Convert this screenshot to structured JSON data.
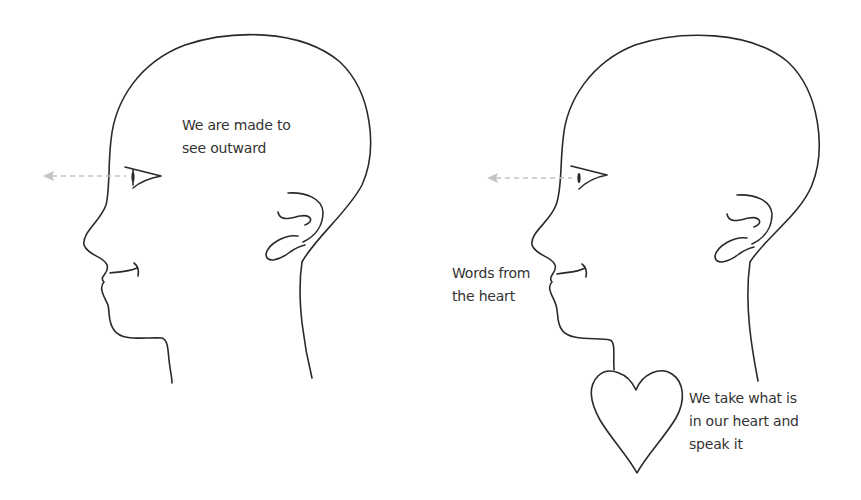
{
  "figure": {
    "left_panel": {
      "caption_lines": [
        "We are made to",
        "see outward"
      ]
    },
    "right_panel": {
      "mouth_caption_lines": [
        "Words from",
        "the heart"
      ],
      "heart_caption_lines": [
        "We take what is",
        "in our heart and",
        "speak it"
      ]
    },
    "colors": {
      "line": "#2a2a2a",
      "gaze_arrow": "#c4c4c4",
      "text": "#333333",
      "background": "#ffffff"
    },
    "icons": [
      "head-profile",
      "eye",
      "dashed-arrow-left",
      "ear",
      "heart"
    ]
  }
}
